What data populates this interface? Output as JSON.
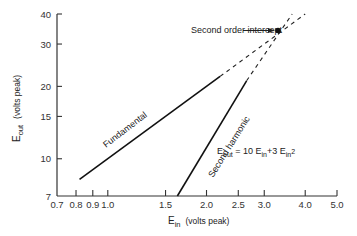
{
  "chart_data": {
    "type": "line",
    "scale": "log-log",
    "title": "",
    "xlabel": "E_in (volts peak)",
    "ylabel": "E_out (volts peak)",
    "xlabel_main": "E",
    "xlabel_sub": "in",
    "xlabel_units": "(volts peak)",
    "ylabel_main": "E",
    "ylabel_sub": "out",
    "ylabel_units": "(volts peak)",
    "xlim": [
      0.7,
      5.0
    ],
    "ylim": [
      7,
      40
    ],
    "x_ticks": [
      {
        "value": 0.7,
        "label": "0.7"
      },
      {
        "value": 0.8,
        "label": "0.8"
      },
      {
        "value": 0.9,
        "label": "0.9"
      },
      {
        "value": 1.0,
        "label": "1.0"
      },
      {
        "value": 1.5,
        "label": "1.5"
      },
      {
        "value": 2.0,
        "label": "2.0"
      },
      {
        "value": 2.5,
        "label": "2.5"
      },
      {
        "value": 3.0,
        "label": "3.0"
      },
      {
        "value": 4.0,
        "label": "4.0"
      },
      {
        "value": 5.0,
        "label": "5.0"
      }
    ],
    "y_ticks": [
      {
        "value": 7,
        "label": "7"
      },
      {
        "value": 10,
        "label": "10"
      },
      {
        "value": 15,
        "label": "15"
      },
      {
        "value": 20,
        "label": "20"
      },
      {
        "value": 30,
        "label": "30"
      },
      {
        "value": 40,
        "label": "40"
      }
    ],
    "grid": false,
    "series": [
      {
        "name": "Fundamental",
        "label": "Fundamental",
        "solid": {
          "x": [
            0.82,
            2.2
          ],
          "y": [
            8.2,
            22
          ]
        },
        "dashed_extension": {
          "x": [
            2.2,
            4.0
          ],
          "y": [
            22,
            40
          ]
        }
      },
      {
        "name": "Second harmonic",
        "label": "Second harmonic",
        "solid": {
          "x": [
            1.63,
            2.65
          ],
          "y": [
            7.0,
            21.1
          ]
        },
        "dashed_extension": {
          "x": [
            2.65,
            3.65
          ],
          "y": [
            21.1,
            40
          ]
        }
      }
    ],
    "annotations": [
      {
        "text": "Second order intercept",
        "point": {
          "x": 3.33,
          "y": 33.3
        },
        "arrow": true
      },
      {
        "text": "E_out = 10 E_in + 3 E_in^2"
      }
    ],
    "equation": {
      "e1": "E",
      "s1": "out",
      "eq": " = 10 ",
      "e2": "E",
      "s2": "in",
      "plus": "+3 ",
      "e3": "E",
      "s3": "in",
      "sup": "2"
    }
  }
}
